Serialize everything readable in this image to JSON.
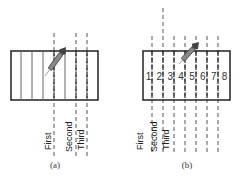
{
  "panels": [
    {
      "id": "a",
      "caption": "(a)",
      "rect": {
        "x": 11,
        "y": 51,
        "w": 87,
        "h": 49
      },
      "solid_dividers": [
        21,
        32,
        43,
        65
      ],
      "dashed_lines": [
        {
          "x": 54,
          "y1": 33,
          "y2": 156,
          "label": "First"
        },
        {
          "x": 76,
          "y1": 33,
          "y2": 156,
          "label": "Second"
        },
        {
          "x": 87,
          "y1": 33,
          "y2": 156,
          "label": "Third"
        }
      ],
      "cell_numbers": [],
      "dart": {
        "tip_x": 45,
        "tip_y": 76,
        "tail_x": 66,
        "tail_y": 47
      },
      "caption_x": 55
    },
    {
      "id": "b",
      "caption": "(b)",
      "rect": {
        "x": 143,
        "y": 51,
        "w": 87,
        "h": 49
      },
      "solid_dividers": [],
      "dashed_lines": [
        {
          "x": 152,
          "y1": 36,
          "y2": 152,
          "label": "First"
        },
        {
          "x": 163,
          "y1": 8,
          "y2": 152,
          "label": "Second"
        },
        {
          "x": 174,
          "y1": 36,
          "y2": 152,
          "label": "Third"
        },
        {
          "x": 185,
          "y1": 36,
          "y2": 152,
          "label": ""
        },
        {
          "x": 196,
          "y1": 36,
          "y2": 152,
          "label": ""
        },
        {
          "x": 207,
          "y1": 36,
          "y2": 152,
          "label": ""
        },
        {
          "x": 218,
          "y1": 36,
          "y2": 152,
          "label": ""
        }
      ],
      "cell_numbers": [
        "1",
        "2",
        "3",
        "4",
        "5",
        "6",
        "7",
        "8"
      ],
      "dart": {
        "tip_x": 179,
        "tip_y": 64,
        "tail_x": 199,
        "tail_y": 42
      },
      "caption_x": 187
    }
  ],
  "labels": {
    "a": [
      {
        "text": "First",
        "x": 51,
        "y": 150
      },
      {
        "text": "Second",
        "x": 72,
        "y": 152
      },
      {
        "text": "Third",
        "x": 84,
        "y": 150
      }
    ],
    "b": [
      {
        "text": "First",
        "x": 143,
        "y": 150
      },
      {
        "text": "Second",
        "x": 157,
        "y": 152
      },
      {
        "text": "Third",
        "x": 169,
        "y": 150
      }
    ]
  },
  "colors": {
    "stroke": "#222222",
    "dash": "#555555",
    "dart": "#444444"
  }
}
